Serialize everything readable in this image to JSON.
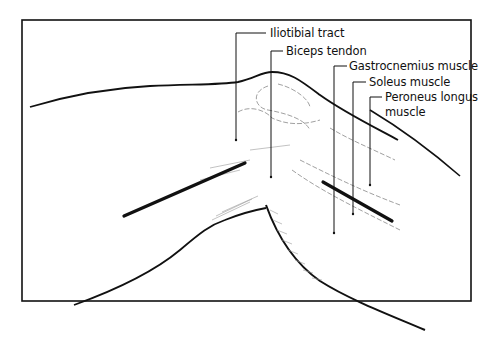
{
  "figure": {
    "colors": {
      "ink": "#111111",
      "background": "#ffffff",
      "shading": "#9a9a9a"
    }
  },
  "labels": [
    {
      "id": "iliotibial",
      "text": "Iliotibial tract",
      "x": 270,
      "y": 27,
      "anchor": [
        236,
        140
      ]
    },
    {
      "id": "biceps",
      "text": "Biceps tendon",
      "x": 286,
      "y": 45,
      "anchor": [
        272,
        177
      ]
    },
    {
      "id": "gastrocnemius",
      "text": "Gastrocnemius muscle",
      "x": 349,
      "y": 60,
      "anchor": [
        334,
        233
      ]
    },
    {
      "id": "soleus",
      "text": "Soleus muscle",
      "x": 369,
      "y": 76,
      "anchor": [
        353,
        214
      ]
    },
    {
      "id": "peroneus_line1",
      "text": "Peroneus longus",
      "x": 385,
      "y": 91,
      "anchor": [
        370,
        185
      ]
    },
    {
      "id": "peroneus_line2",
      "text": "muscle",
      "x": 385,
      "y": 106
    }
  ]
}
